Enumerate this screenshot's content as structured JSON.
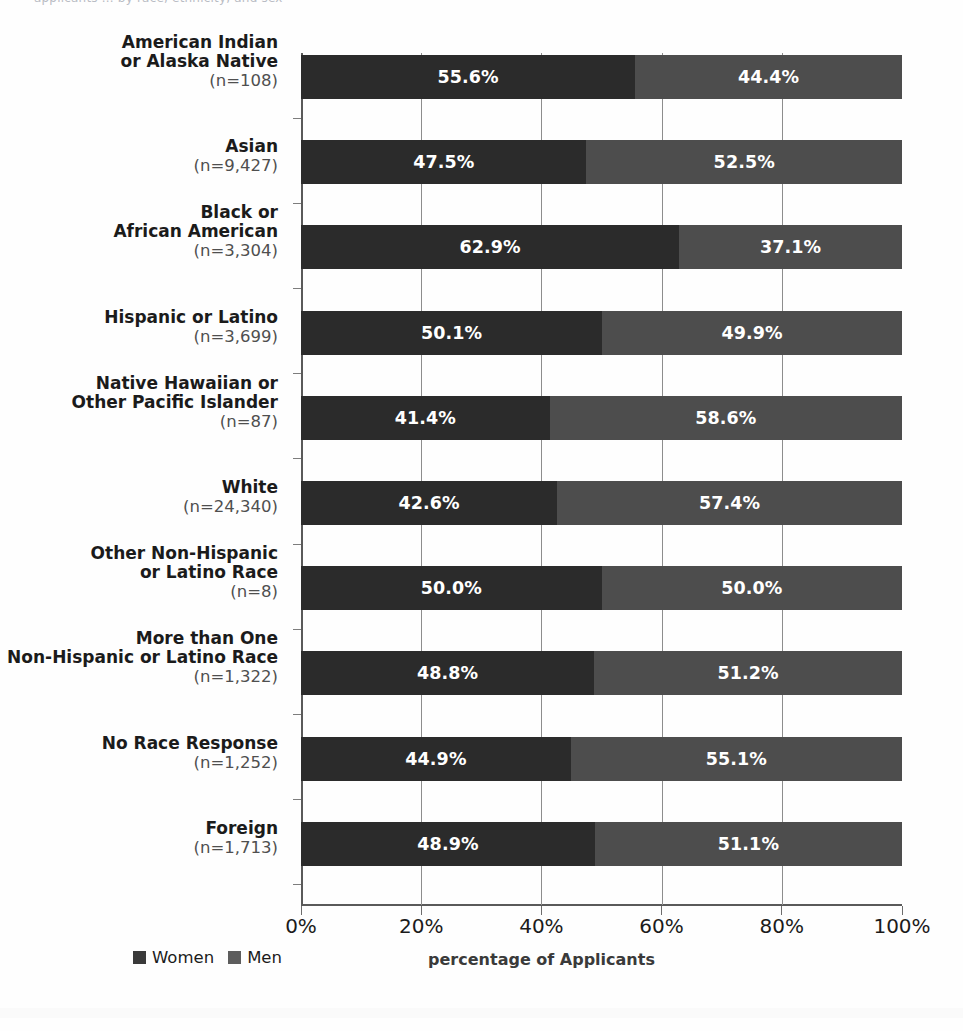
{
  "page": {
    "clipped_header_text": "applicants ... by race, ethnicity, and sex"
  },
  "chart_data": {
    "type": "bar",
    "orientation": "horizontal",
    "stacked": true,
    "normalized_percent": true,
    "title": "",
    "xlabel": "percentage of Applicants",
    "ylabel": "",
    "xlim": [
      0,
      100
    ],
    "grid": "vertical",
    "legend_position": "bottom-left",
    "xticks": [
      "0%",
      "20%",
      "40%",
      "60%",
      "80%",
      "100%"
    ],
    "xtick_values": [
      0,
      20,
      40,
      60,
      80,
      100
    ],
    "legend": [
      "Women",
      "Men"
    ],
    "colors": {
      "women": "#2b2b2b",
      "men": "#4d4d4d"
    },
    "categories": [
      "American Indian\nor Alaska Native",
      "Asian",
      "Black or\nAfrican American",
      "Hispanic or Latino",
      "Native Hawaiian or\nOther Pacific Islander",
      "White",
      "Other Non-Hispanic\nor Latino Race",
      "More than One\nNon-Hispanic or Latino Race",
      "No Race Response",
      "Foreign"
    ],
    "category_counts": [
      "(n=108)",
      "(n=9,427)",
      "(n=3,304)",
      "(n=3,699)",
      "(n=87)",
      "(n=24,340)",
      "(n=8)",
      "(n=1,322)",
      "(n=1,252)",
      "(n=1,713)"
    ],
    "series": [
      {
        "name": "Women",
        "values": [
          55.6,
          47.5,
          62.9,
          50.1,
          41.4,
          42.6,
          50.0,
          48.8,
          44.9,
          48.9
        ],
        "labels": [
          "55.6%",
          "47.5%",
          "62.9%",
          "50.1%",
          "41.4%",
          "42.6%",
          "50.0%",
          "48.8%",
          "44.9%",
          "48.9%"
        ]
      },
      {
        "name": "Men",
        "values": [
          44.4,
          52.5,
          37.1,
          49.9,
          58.6,
          57.4,
          50.0,
          51.2,
          55.1,
          51.1
        ],
        "labels": [
          "44.4%",
          "52.5%",
          "37.1%",
          "49.9%",
          "58.6%",
          "57.4%",
          "50.0%",
          "51.2%",
          "55.1%",
          "51.1%"
        ]
      }
    ]
  }
}
